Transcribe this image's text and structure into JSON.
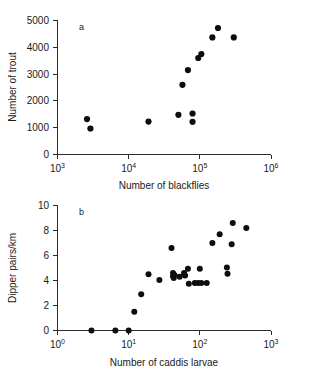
{
  "figure": {
    "caption": "",
    "panels": [
      "a",
      "b"
    ]
  },
  "chart_data": [
    {
      "type": "scatter",
      "panel_label": "a",
      "title": "",
      "xlabel": "Number of blackflies",
      "ylabel": "Number of trout",
      "xscale": "log",
      "yscale": "linear",
      "xlim": [
        1000,
        1000000
      ],
      "ylim": [
        0,
        5000
      ],
      "xticks": [
        1000,
        10000,
        100000,
        1000000
      ],
      "xtick_labels": [
        "10³",
        "10⁴",
        "10⁵",
        "10⁶"
      ],
      "xtick_bases": [
        "10",
        "10",
        "10",
        "10"
      ],
      "xtick_exponents": [
        "3",
        "4",
        "5",
        "6"
      ],
      "yticks": [
        0,
        1000,
        2000,
        3000,
        4000,
        5000
      ],
      "ytick_labels": [
        "0",
        "1000",
        "2000",
        "3000",
        "4000",
        "5000"
      ],
      "grid": false,
      "legend": false,
      "marker": "filled-circle",
      "marker_color": "#0d0d0d",
      "points": [
        {
          "x": 2600,
          "y": 1320
        },
        {
          "x": 2900,
          "y": 970
        },
        {
          "x": 19000,
          "y": 1230
        },
        {
          "x": 50000,
          "y": 1480
        },
        {
          "x": 57000,
          "y": 2600
        },
        {
          "x": 68000,
          "y": 3150
        },
        {
          "x": 79000,
          "y": 1530
        },
        {
          "x": 79000,
          "y": 1220
        },
        {
          "x": 95000,
          "y": 3600
        },
        {
          "x": 105000,
          "y": 3750
        },
        {
          "x": 150000,
          "y": 4370
        },
        {
          "x": 180000,
          "y": 4720
        },
        {
          "x": 300000,
          "y": 4370
        }
      ]
    },
    {
      "type": "scatter",
      "panel_label": "b",
      "title": "",
      "xlabel": "Number of caddis larvae",
      "ylabel": "Dipper pairs/km",
      "xscale": "log",
      "yscale": "linear",
      "xlim": [
        1,
        1000
      ],
      "ylim": [
        0,
        10
      ],
      "xticks": [
        1,
        10,
        100,
        1000
      ],
      "xtick_labels": [
        "10⁰",
        "10¹",
        "10²",
        "10³"
      ],
      "xtick_bases": [
        "10",
        "10",
        "10",
        "10"
      ],
      "xtick_exponents": [
        "0",
        "1",
        "2",
        "3"
      ],
      "yticks": [
        0,
        2,
        4,
        6,
        8,
        10
      ],
      "ytick_labels": [
        "0",
        "2",
        "4",
        "6",
        "8",
        "10"
      ],
      "grid": false,
      "legend": false,
      "marker": "filled-circle",
      "marker_color": "#0d0d0d",
      "points": [
        {
          "x": 3,
          "y": 0.0
        },
        {
          "x": 6.5,
          "y": 0.0
        },
        {
          "x": 10,
          "y": 0.0
        },
        {
          "x": 12,
          "y": 1.5
        },
        {
          "x": 15,
          "y": 2.9
        },
        {
          "x": 19,
          "y": 4.5
        },
        {
          "x": 27,
          "y": 4.05
        },
        {
          "x": 40,
          "y": 6.6
        },
        {
          "x": 42,
          "y": 4.6
        },
        {
          "x": 42,
          "y": 4.35
        },
        {
          "x": 43,
          "y": 4.2
        },
        {
          "x": 44,
          "y": 4.45
        },
        {
          "x": 52,
          "y": 4.3
        },
        {
          "x": 60,
          "y": 4.6
        },
        {
          "x": 62,
          "y": 4.4
        },
        {
          "x": 68,
          "y": 4.95
        },
        {
          "x": 70,
          "y": 3.75
        },
        {
          "x": 85,
          "y": 3.8
        },
        {
          "x": 95,
          "y": 3.8
        },
        {
          "x": 100,
          "y": 4.95
        },
        {
          "x": 105,
          "y": 3.8
        },
        {
          "x": 125,
          "y": 3.8
        },
        {
          "x": 150,
          "y": 7.0
        },
        {
          "x": 190,
          "y": 7.7
        },
        {
          "x": 240,
          "y": 5.05
        },
        {
          "x": 245,
          "y": 4.55
        },
        {
          "x": 280,
          "y": 6.9
        },
        {
          "x": 290,
          "y": 8.6
        },
        {
          "x": 450,
          "y": 8.2
        }
      ]
    }
  ]
}
